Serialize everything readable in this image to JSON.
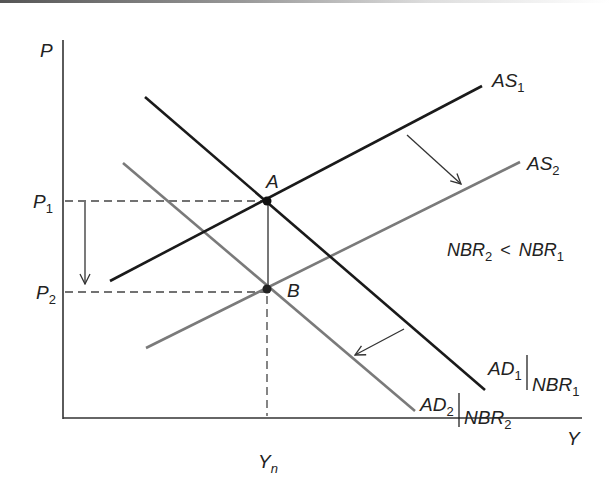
{
  "diagram": {
    "type": "AD-AS shift diagram",
    "axes": {
      "y_label": "P",
      "x_label": "Y",
      "y_ticks": [
        {
          "label": "P",
          "sub": "1",
          "y": 201
        },
        {
          "label": "P",
          "sub": "2",
          "y": 292
        }
      ],
      "x_ticks": [
        {
          "label": "Y",
          "sub": "n",
          "x": 267
        }
      ]
    },
    "curves": {
      "as1": {
        "label": "AS",
        "sub": "1",
        "color": "#1a1a1a"
      },
      "as2": {
        "label": "AS",
        "sub": "2",
        "color": "#7a7a7a"
      },
      "ad1": {
        "label": "AD",
        "sub": "1",
        "cond": "NBR",
        "cond_sub": "1",
        "color": "#1a1a1a"
      },
      "ad2": {
        "label": "AD",
        "sub": "2",
        "cond": "NBR",
        "cond_sub": "2",
        "color": "#7a7a7a"
      }
    },
    "points": {
      "a": {
        "label": "A"
      },
      "b": {
        "label": "B"
      }
    },
    "annotation": {
      "left": "NBR",
      "left_sub": "2",
      "op": "<",
      "right": "NBR",
      "right_sub": "1"
    },
    "arrows": [
      {
        "name": "as-shift-arrow",
        "direction": "down-right"
      },
      {
        "name": "ad-shift-arrow",
        "direction": "down-left"
      },
      {
        "name": "price-drop-arrow",
        "direction": "down"
      }
    ]
  }
}
